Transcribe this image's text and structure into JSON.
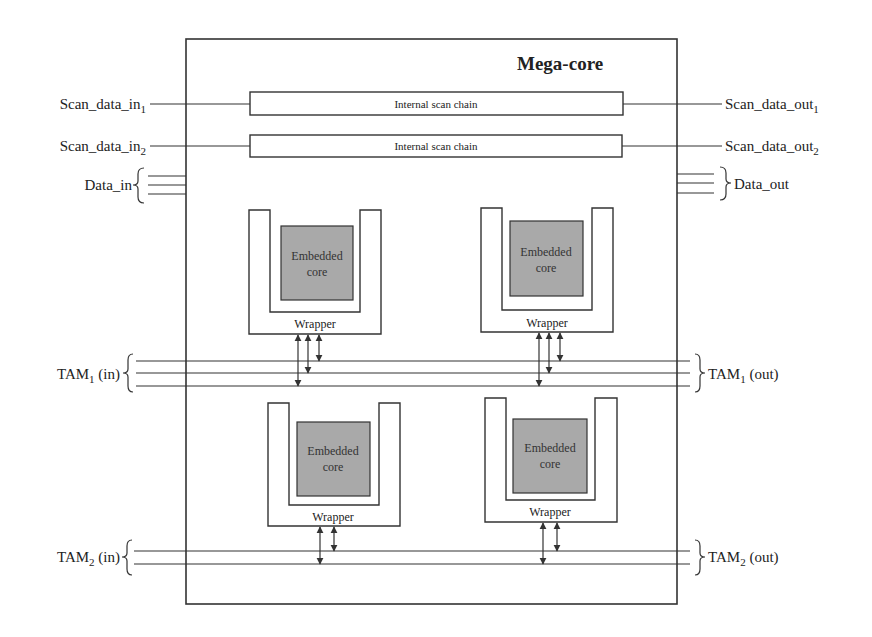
{
  "diagram": {
    "title": "Mega-core",
    "scan_chains": [
      {
        "in_label": "Scan_data_in",
        "in_sub": "1",
        "chain_label": "Internal scan chain",
        "out_label": "Scan_data_out",
        "out_sub": "1"
      },
      {
        "in_label": "Scan_data_in",
        "in_sub": "2",
        "chain_label": "Internal scan chain",
        "out_label": "Scan_data_out",
        "out_sub": "2"
      }
    ],
    "data_in_label": "Data_in",
    "data_out_label": "Data_out",
    "cores": [
      {
        "line1": "Embedded",
        "line2": "core",
        "wrapper_label": "Wrapper",
        "tam": "TAM1",
        "arrow_count": 3
      },
      {
        "line1": "Embedded",
        "line2": "core",
        "wrapper_label": "Wrapper",
        "tam": "TAM1",
        "arrow_count": 3
      },
      {
        "line1": "Embedded",
        "line2": "core",
        "wrapper_label": "Wrapper",
        "tam": "TAM2",
        "arrow_count": 2
      },
      {
        "line1": "Embedded",
        "line2": "core",
        "wrapper_label": "Wrapper",
        "tam": "TAM2",
        "arrow_count": 2
      }
    ],
    "tams": [
      {
        "name": "TAM",
        "sub": "1",
        "in_suffix": "(in)",
        "out_suffix": "(out)",
        "width": 3
      },
      {
        "name": "TAM",
        "sub": "2",
        "in_suffix": "(in)",
        "out_suffix": "(out)",
        "width": 2
      }
    ],
    "colors": {
      "line": "#333333",
      "core_fill": "#a9a9a9",
      "background": "#ffffff"
    }
  }
}
